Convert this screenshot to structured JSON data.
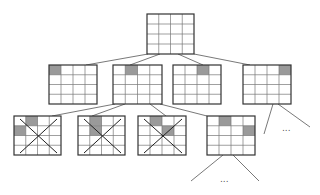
{
  "colors": {
    "grid_line": "#333333",
    "grid_inner": "#777777",
    "shaded": "#9a9a9a",
    "edge": "#555555",
    "cross": "#222222"
  },
  "grid": {
    "rows": 4,
    "cols": 4
  },
  "nodes": [
    {
      "id": "root",
      "x": 147,
      "y": 14,
      "w": 47,
      "h": 40,
      "shaded": [],
      "crossed": false
    },
    {
      "id": "l1-a",
      "x": 49,
      "y": 65,
      "w": 48,
      "h": 39,
      "shaded": [
        [
          0,
          0
        ]
      ],
      "crossed": false
    },
    {
      "id": "l1-b",
      "x": 113,
      "y": 65,
      "w": 49,
      "h": 39,
      "shaded": [
        [
          1,
          0
        ]
      ],
      "crossed": false
    },
    {
      "id": "l1-c",
      "x": 173,
      "y": 65,
      "w": 48,
      "h": 39,
      "shaded": [
        [
          2,
          0
        ]
      ],
      "crossed": false
    },
    {
      "id": "l1-d",
      "x": 243,
      "y": 65,
      "w": 48,
      "h": 39,
      "shaded": [
        [
          3,
          0
        ]
      ],
      "crossed": false
    },
    {
      "id": "l2-a",
      "x": 14,
      "y": 116,
      "w": 47,
      "h": 39,
      "shaded": [
        [
          1,
          0
        ],
        [
          0,
          1
        ]
      ],
      "crossed": true
    },
    {
      "id": "l2-b",
      "x": 78,
      "y": 116,
      "w": 47,
      "h": 39,
      "shaded": [
        [
          1,
          0
        ],
        [
          1,
          1
        ]
      ],
      "crossed": true
    },
    {
      "id": "l2-c",
      "x": 138,
      "y": 116,
      "w": 48,
      "h": 39,
      "shaded": [
        [
          1,
          0
        ],
        [
          2,
          1
        ]
      ],
      "crossed": true
    },
    {
      "id": "l2-d",
      "x": 207,
      "y": 116,
      "w": 48,
      "h": 39,
      "shaded": [
        [
          1,
          0
        ],
        [
          3,
          1
        ]
      ],
      "crossed": false
    }
  ],
  "edges": [
    [
      148,
      54,
      86,
      65
    ],
    [
      160,
      54,
      130,
      65
    ],
    [
      178,
      54,
      203,
      65
    ],
    [
      194,
      54,
      250,
      65
    ],
    [
      115,
      104,
      52,
      116
    ],
    [
      125,
      104,
      92,
      116
    ],
    [
      150,
      104,
      166,
      116
    ],
    [
      160,
      104,
      207,
      116
    ],
    [
      273,
      104,
      264,
      134
    ],
    [
      278,
      104,
      310,
      127
    ],
    [
      223,
      155,
      191,
      181
    ],
    [
      233,
      155,
      259,
      181
    ]
  ],
  "ellipses": [
    {
      "id": "more-l1-d",
      "x": 282,
      "y": 131,
      "text": "..."
    },
    {
      "id": "more-l2-d",
      "x": 220,
      "y": 182,
      "text": "..."
    }
  ]
}
